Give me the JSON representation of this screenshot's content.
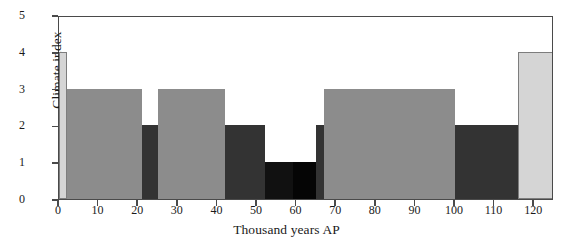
{
  "chart_data": {
    "type": "bar",
    "title": "",
    "xlabel": "Thousand years AP",
    "ylabel": "Climate index",
    "xlim": [
      0,
      125
    ],
    "ylim": [
      0,
      5
    ],
    "xticks": [
      0,
      10,
      20,
      30,
      40,
      50,
      60,
      70,
      80,
      90,
      100,
      110,
      120
    ],
    "yticks": [
      0,
      1,
      2,
      3,
      4,
      5
    ],
    "grid": false,
    "legend": false,
    "note": "Step/stair plot of climate index over time; bar fill shade varies with index level",
    "shades": {
      "level_4": "#d5d5d5",
      "level_3": "#8c8c8c",
      "level_2": "#333333",
      "level_1": "#111111",
      "frame": "#4a4a4a"
    },
    "segments": [
      {
        "x_start": 0,
        "x_end": 2,
        "value": 4,
        "color": "#d5d5d5"
      },
      {
        "x_start": 2,
        "x_end": 21,
        "value": 3,
        "color": "#8c8c8c"
      },
      {
        "x_start": 21,
        "x_end": 25,
        "value": 2,
        "color": "#333333"
      },
      {
        "x_start": 25,
        "x_end": 42,
        "value": 3,
        "color": "#8c8c8c"
      },
      {
        "x_start": 42,
        "x_end": 52,
        "value": 2,
        "color": "#333333"
      },
      {
        "x_start": 52,
        "x_end": 59,
        "value": 1,
        "color": "#111111"
      },
      {
        "x_start": 59,
        "x_end": 65,
        "value": 1,
        "color": "#050505"
      },
      {
        "x_start": 65,
        "x_end": 67,
        "value": 2,
        "color": "#333333"
      },
      {
        "x_start": 67,
        "x_end": 100,
        "value": 3,
        "color": "#8c8c8c"
      },
      {
        "x_start": 100,
        "x_end": 116,
        "value": 2,
        "color": "#333333"
      },
      {
        "x_start": 116,
        "x_end": 125,
        "value": 4,
        "color": "#d5d5d5"
      }
    ]
  }
}
